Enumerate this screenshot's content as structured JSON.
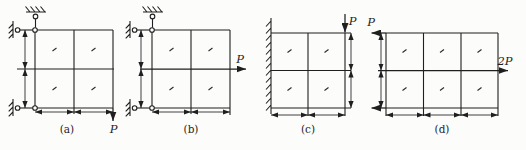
{
  "figure": {
    "dim_label": "a",
    "colors": {
      "ink": "#1f1f1f",
      "background": "#fcfcfb"
    },
    "panels": [
      {
        "id": "a",
        "caption": "(a)",
        "grid": {
          "rows": 2,
          "cols": 2
        },
        "supports": [
          "ceiling-pin-link",
          "wall-pin-link-top",
          "wall-pin-link-bottom"
        ],
        "loads": [
          {
            "label": "P",
            "direction": "down",
            "position": "bottom-right"
          }
        ]
      },
      {
        "id": "b",
        "caption": "(b)",
        "grid": {
          "rows": 2,
          "cols": 2
        },
        "supports": [
          "ceiling-pin-link",
          "wall-pin-link-top",
          "wall-pin-link-bottom"
        ],
        "loads": [
          {
            "label": "P",
            "direction": "right",
            "position": "mid-right"
          }
        ]
      },
      {
        "id": "c",
        "caption": "(c)",
        "grid": {
          "rows": 2,
          "cols": 2
        },
        "supports": [
          "fixed-wall-left"
        ],
        "loads": [
          {
            "label": "P",
            "direction": "down",
            "position": "top-right"
          }
        ]
      },
      {
        "id": "d",
        "caption": "(d)",
        "grid": {
          "rows": 2,
          "cols": 3
        },
        "supports": [],
        "loads": [
          {
            "label": "P",
            "direction": "left",
            "position": "top-left"
          },
          {
            "label": "",
            "direction": "left",
            "position": "bottom-left"
          },
          {
            "label": "2P",
            "direction": "right",
            "position": "mid-right"
          }
        ]
      }
    ]
  }
}
